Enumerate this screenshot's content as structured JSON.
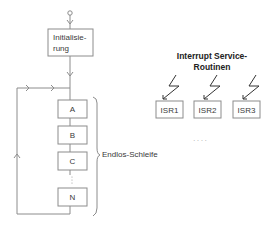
{
  "main_loop": {
    "init_label_line1": "Initialisie-",
    "init_label_line2": "rung",
    "steps": [
      "A",
      "B",
      "C",
      "N"
    ],
    "ellipsis": "⋮",
    "loop_label": "Endlos-Schleife"
  },
  "interrupts": {
    "title_line1": "Interrupt Service-",
    "title_line2": "Routinen",
    "routines": [
      "ISR1",
      "ISR2",
      "ISR3"
    ],
    "ellipsis": ". . . ."
  },
  "colors": {
    "line": "#8c8c8c",
    "text": "#3a3a3a",
    "bolt": "#333333"
  }
}
